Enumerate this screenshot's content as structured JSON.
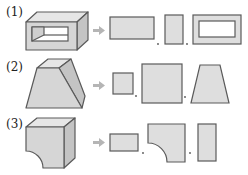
{
  "problems": [
    {
      "label": "(1)",
      "solid": "rectangular-tube",
      "views": [
        "wide-rectangle",
        "narrow-rectangle",
        "rectangle-with-rectangular-hole"
      ]
    },
    {
      "label": "(2)",
      "solid": "square-frustum",
      "views": [
        "small-square",
        "large-square",
        "trapezoid"
      ]
    },
    {
      "label": "(3)",
      "solid": "block-with-quarter-circle-cutout",
      "views": [
        "wide-rectangle",
        "square-with-quarter-circle-notch",
        "narrow-rectangle"
      ]
    }
  ],
  "separator": ",",
  "arrow_icon": "right-arrow-icon"
}
